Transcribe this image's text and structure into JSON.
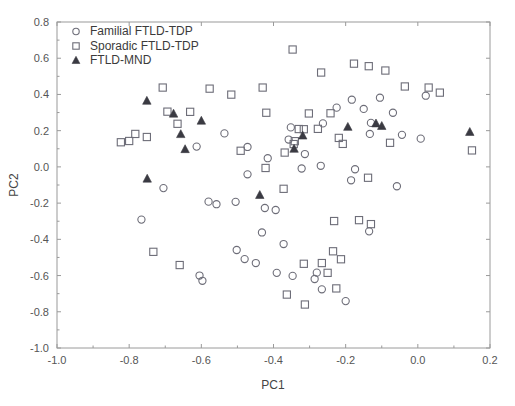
{
  "chart_data": {
    "type": "scatter",
    "title": "",
    "xlabel": "PC1",
    "ylabel": "PC2",
    "xlim": [
      -1.0,
      0.2
    ],
    "ylim": [
      -1.0,
      0.8
    ],
    "xticks": [
      "-1.0",
      "-0.8",
      "-0.6",
      "-0.4",
      "-0.2",
      "0.0",
      "0.2"
    ],
    "xtick_values": [
      -1.0,
      -0.8,
      -0.6,
      -0.4,
      -0.2,
      0.0,
      0.2
    ],
    "yticks": [
      "-1.0",
      "-0.8",
      "-0.6",
      "-0.4",
      "-0.2",
      "0.0",
      "0.2",
      "0.4",
      "0.6",
      "0.8"
    ],
    "ytick_values": [
      -1.0,
      -0.8,
      -0.6,
      -0.4,
      -0.2,
      0.0,
      0.2,
      0.4,
      0.6,
      0.8
    ],
    "grid": false,
    "legend_position": "top-left",
    "series": [
      {
        "name": "Familial FTLD-TDP",
        "marker": "open-circle",
        "color": "#6d6d78",
        "points": [
          [
            -0.536,
            0.185
          ],
          [
            -0.472,
            0.11
          ],
          [
            -0.352,
            0.218
          ],
          [
            -0.358,
            0.151
          ],
          [
            -0.263,
            0.24
          ],
          [
            -0.225,
            0.327
          ],
          [
            -0.183,
            0.371
          ],
          [
            -0.15,
            0.32
          ],
          [
            -0.105,
            0.382
          ],
          [
            -0.069,
            0.299
          ],
          [
            -0.13,
            0.243
          ],
          [
            -0.133,
            0.182
          ],
          [
            -0.044,
            0.177
          ],
          [
            0.008,
            0.156
          ],
          [
            0.022,
            0.393
          ],
          [
            -0.705,
            -0.117
          ],
          [
            -0.613,
            0.112
          ],
          [
            -0.416,
            0.048
          ],
          [
            -0.472,
            -0.041
          ],
          [
            -0.313,
            0.071
          ],
          [
            -0.322,
            -0.009
          ],
          [
            -0.269,
            0.006
          ],
          [
            -0.174,
            -0.013
          ],
          [
            -0.185,
            -0.074
          ],
          [
            -0.058,
            -0.107
          ],
          [
            -0.766,
            -0.291
          ],
          [
            -0.58,
            -0.192
          ],
          [
            -0.558,
            -0.206
          ],
          [
            -0.505,
            -0.193
          ],
          [
            -0.424,
            -0.227
          ],
          [
            -0.394,
            -0.238
          ],
          [
            -0.135,
            -0.356
          ],
          [
            -0.432,
            -0.362
          ],
          [
            -0.372,
            -0.426
          ],
          [
            -0.502,
            -0.459
          ],
          [
            -0.48,
            -0.509
          ],
          [
            -0.449,
            -0.531
          ],
          [
            -0.391,
            -0.585
          ],
          [
            -0.347,
            -0.602
          ],
          [
            -0.28,
            -0.584
          ],
          [
            -0.286,
            -0.619
          ],
          [
            -0.605,
            -0.6
          ],
          [
            -0.597,
            -0.629
          ],
          [
            -0.266,
            -0.676
          ],
          [
            -0.2,
            -0.741
          ]
        ]
      },
      {
        "name": "Sporadic FTLD-TDP",
        "marker": "open-square",
        "color": "#6d6d78",
        "points": [
          [
            -0.707,
            0.438
          ],
          [
            -0.577,
            0.432
          ],
          [
            -0.517,
            0.399
          ],
          [
            -0.694,
            0.305
          ],
          [
            -0.666,
            0.238
          ],
          [
            -0.631,
            0.304
          ],
          [
            -0.8,
            0.143
          ],
          [
            -0.783,
            0.182
          ],
          [
            -0.751,
            0.165
          ],
          [
            -0.823,
            0.136
          ],
          [
            -0.43,
            0.438
          ],
          [
            -0.347,
            0.648
          ],
          [
            -0.268,
            0.521
          ],
          [
            -0.177,
            0.57
          ],
          [
            -0.136,
            0.556
          ],
          [
            -0.09,
            0.532
          ],
          [
            -0.036,
            0.444
          ],
          [
            0.03,
            0.438
          ],
          [
            0.061,
            0.41
          ],
          [
            0.15,
            0.091
          ],
          [
            -0.42,
            0.299
          ],
          [
            -0.302,
            0.295
          ],
          [
            -0.242,
            0.296
          ],
          [
            -0.316,
            0.208
          ],
          [
            -0.277,
            0.21
          ],
          [
            -0.33,
            0.209
          ],
          [
            -0.219,
            0.16
          ],
          [
            -0.341,
            0.142
          ],
          [
            -0.344,
            0.126
          ],
          [
            -0.208,
            0.127
          ],
          [
            -0.077,
            0.133
          ],
          [
            -0.369,
            0.079
          ],
          [
            -0.138,
            -0.06
          ],
          [
            -0.372,
            -0.121
          ],
          [
            -0.491,
            0.089
          ],
          [
            -0.422,
            -0.006
          ],
          [
            -0.232,
            -0.299
          ],
          [
            -0.163,
            -0.294
          ],
          [
            -0.13,
            -0.316
          ],
          [
            -0.235,
            -0.466
          ],
          [
            -0.213,
            -0.51
          ],
          [
            -0.316,
            -0.535
          ],
          [
            -0.266,
            -0.531
          ],
          [
            -0.25,
            -0.585
          ],
          [
            -0.226,
            -0.671
          ],
          [
            -0.363,
            -0.705
          ],
          [
            -0.313,
            -0.76
          ],
          [
            -0.733,
            -0.469
          ],
          [
            -0.66,
            -0.542
          ]
        ]
      },
      {
        "name": "FTLD-MND",
        "marker": "filled-triangle",
        "color": "#3a3a42",
        "points": [
          [
            -0.751,
            0.364
          ],
          [
            -0.677,
            0.293
          ],
          [
            -0.6,
            0.254
          ],
          [
            -0.657,
            0.18
          ],
          [
            -0.645,
            0.097
          ],
          [
            -0.75,
            -0.066
          ],
          [
            -0.438,
            -0.156
          ],
          [
            -0.343,
            0.099
          ],
          [
            -0.319,
            0.172
          ],
          [
            -0.194,
            0.22
          ],
          [
            -0.116,
            0.239
          ],
          [
            -0.1,
            0.225
          ],
          [
            0.144,
            0.192
          ]
        ]
      }
    ]
  },
  "legend": {
    "items": [
      {
        "label": "Familial FTLD-TDP",
        "marker": "open-circle"
      },
      {
        "label": "Sporadic FTLD-TDP",
        "marker": "open-square"
      },
      {
        "label": "FTLD-MND",
        "marker": "filled-triangle"
      }
    ]
  }
}
